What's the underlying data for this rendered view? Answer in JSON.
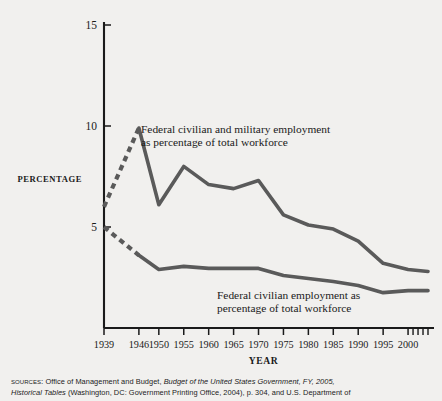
{
  "figure": {
    "background_color": "#f1f0ee",
    "line_color": "#5a5a5a",
    "axis_color": "#1a1a1a",
    "ylabel": "PERCENTAGE",
    "xlabel": "YEAR"
  },
  "sources": {
    "kicker": "SOURCES:",
    "line1_a": "Office of Management and Budget, ",
    "line1_italic": "Budget of the United States Government, FY, 2005,",
    "line2_italic": "Historical Tables",
    "line2_b": " (Washington, DC: Government Printing Office, 2004), p. 304, and U.S. Department of"
  },
  "chart_data": {
    "type": "line",
    "title": "",
    "xlabel": "YEAR",
    "ylabel": "PERCENTAGE",
    "xlim": [
      1939,
      2004
    ],
    "ylim": [
      0,
      15
    ],
    "grid": false,
    "legend_position": "inline-annotations",
    "ytick_labels": [
      "5",
      "10",
      "15"
    ],
    "yticks": [
      5,
      10,
      15
    ],
    "xtick_labels": [
      "1939",
      "1946",
      "1950",
      "1955",
      "1960",
      "1965",
      "1970",
      "1975",
      "1980",
      "1985",
      "1990",
      "1995",
      "2000"
    ],
    "xticks": [
      1939,
      1946,
      1950,
      1955,
      1960,
      1965,
      1970,
      1975,
      1980,
      1985,
      1990,
      1995,
      2000
    ],
    "extra_minor_xticks": [
      2001,
      2002,
      2003,
      2004
    ],
    "series": [
      {
        "name": "Federal civilian and military employment as percentage of total workforce",
        "label_line1": "Federal civilian and military employment",
        "label_line2": "as percentage of total workforce",
        "style": "dashed-then-solid",
        "dashed_until_x": 1946,
        "x": [
          1939,
          1946,
          1950,
          1955,
          1960,
          1965,
          1970,
          1975,
          1980,
          1985,
          1990,
          1995,
          2000,
          2004
        ],
        "values": [
          6.0,
          9.9,
          6.1,
          8.0,
          7.1,
          6.9,
          7.3,
          5.6,
          5.1,
          4.9,
          4.3,
          3.2,
          2.9,
          2.8
        ]
      },
      {
        "name": "Federal civilian employment as percentage of total workforce",
        "label_line1": "Federal civilian employment as",
        "label_line2": "percentage of total workforce",
        "style": "dashed-then-solid",
        "dashed_until_x": 1948,
        "x": [
          1939,
          1946,
          1950,
          1955,
          1960,
          1965,
          1970,
          1975,
          1980,
          1985,
          1990,
          1995,
          2000,
          2004
        ],
        "values": [
          5.0,
          3.6,
          2.9,
          3.05,
          2.95,
          2.95,
          2.95,
          2.6,
          2.45,
          2.3,
          2.1,
          1.75,
          1.85,
          1.85
        ]
      }
    ]
  }
}
